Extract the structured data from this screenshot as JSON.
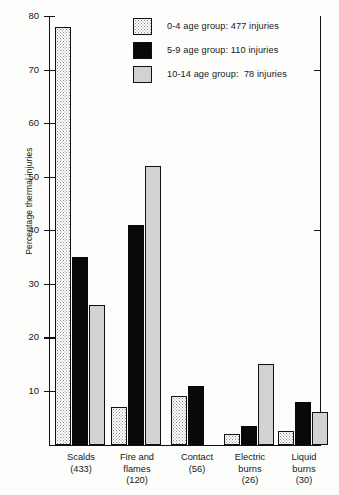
{
  "chart_data": {
    "type": "bar",
    "title": "",
    "xlabel": "",
    "ylabel": "Percentage thermal injuries",
    "ylim": [
      0,
      80
    ],
    "yticks": [
      10,
      20,
      30,
      40,
      50,
      60,
      70,
      80
    ],
    "grid": false,
    "legend_position": "top-center",
    "categories": [
      "Scalds\n(433)",
      "Fire and\nflames\n(120)",
      "Contact\n(56)",
      "Electric\nburns\n(26)",
      "Liquid\nburns\n(30)"
    ],
    "category_labels": [
      {
        "name": "Scalds",
        "count": "(433)"
      },
      {
        "name": "Fire and\nflames",
        "count": "(120)"
      },
      {
        "name": "Contact",
        "count": "(56)"
      },
      {
        "name": "Electric\nburns",
        "count": "(26)"
      },
      {
        "name": "Liquid\nburns",
        "count": "(30)"
      }
    ],
    "series": [
      {
        "name": "0-4 age group: 477 injuries",
        "key": "0-4",
        "swatch": "dotted",
        "color": "#ffffff",
        "values": [
          78,
          7,
          9,
          2,
          2.5
        ]
      },
      {
        "name": "5-9 age group: 110 injuries",
        "key": "5-9",
        "swatch": "solid-black",
        "color": "#090909",
        "values": [
          35,
          41,
          11,
          3.5,
          8
        ]
      },
      {
        "name": "10-14 age group:  78 injuries",
        "key": "10-14",
        "swatch": "light-grey",
        "color": "#d2d2d2",
        "values": [
          26,
          52,
          0,
          15,
          6
        ]
      }
    ]
  },
  "legend": {
    "items": [
      {
        "label": "0-4 age group: 477 injuries",
        "swatch": "dotted"
      },
      {
        "label": "5-9 age group: 110 injuries",
        "swatch": "solid-black"
      },
      {
        "label": "10-14 age group:  78 injuries",
        "swatch": "light-grey"
      }
    ]
  },
  "axis": {
    "y_label": "Percentage thermal injuries",
    "y_ticks": [
      "80",
      "70",
      "60",
      "50",
      "40",
      "30",
      "20",
      "10"
    ]
  }
}
